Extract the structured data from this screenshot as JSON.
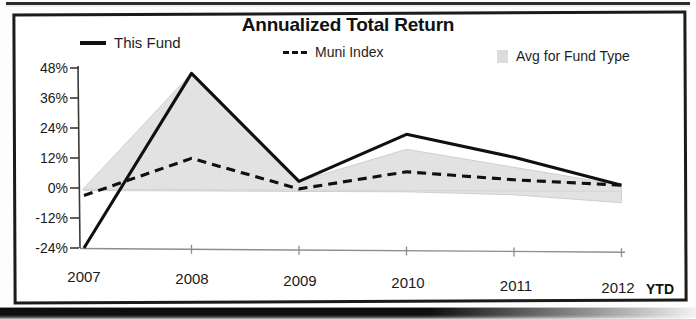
{
  "chart_data": {
    "type": "line",
    "title": "Annualized Total Return",
    "xlabel": "",
    "ylabel": "",
    "categories": [
      "2007",
      "2008",
      "2009",
      "2010",
      "2011",
      "2012"
    ],
    "x_axis_note": "YTD",
    "ylim": [
      -24,
      48
    ],
    "yticks": [
      48,
      36,
      24,
      12,
      0,
      -12,
      -24
    ],
    "ytick_labels": [
      "48%",
      "36%",
      "24%",
      "12%",
      "0%",
      "-12%",
      "-24%"
    ],
    "grid": false,
    "legend_position": "top",
    "series": [
      {
        "name": "This Fund",
        "style": "solid",
        "color": "#101010",
        "values": [
          -24,
          46,
          3,
          22,
          13,
          2
        ]
      },
      {
        "name": "Muni Index",
        "style": "dashed",
        "color": "#101010",
        "values": [
          -3,
          12,
          0,
          7,
          4,
          2
        ]
      },
      {
        "name": "Avg for Fund Type",
        "style": "band",
        "color": "#e2e2e2",
        "band_upper": [
          0,
          46,
          3,
          16,
          9,
          2
        ],
        "band_lower": [
          -1,
          -1,
          -1,
          -1,
          -2,
          -5
        ]
      }
    ]
  },
  "legend": {
    "items": [
      {
        "label": "This Fund",
        "marker": "solid-line-swatch"
      },
      {
        "label": "Muni Index",
        "marker": "dashed-line-swatch"
      },
      {
        "label": "Avg for Fund Type",
        "marker": "gray-box-swatch"
      }
    ]
  },
  "axes": {
    "y_labels": [
      "48%",
      "36%",
      "24%",
      "12%",
      "0%",
      "-12%",
      "-24%"
    ],
    "x_labels": [
      "2007",
      "2008",
      "2009",
      "2010",
      "2011",
      "2012"
    ],
    "x_suffix": "YTD"
  },
  "colors": {
    "line": "#101010",
    "band": "#e2e2e2",
    "axis": "#3a3a3a",
    "border": "#1b1b1b"
  }
}
